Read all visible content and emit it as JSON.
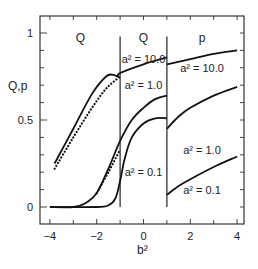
{
  "chart_data": {
    "type": "line",
    "title": "",
    "xlabel": "b²",
    "ylabel": "Q,p",
    "xlim": [
      -4.4,
      4.3
    ],
    "ylim": [
      -0.1,
      1.1
    ],
    "xticks": [
      -4,
      -2,
      0,
      2,
      4
    ],
    "xtick_labels": [
      "−4",
      "−2",
      "0",
      "2",
      "4"
    ],
    "yticks": [
      0,
      0.5,
      1
    ],
    "ytick_labels": [
      "0",
      "0.5",
      "1"
    ],
    "grid": false,
    "legend": null,
    "region_boundaries": [
      -1,
      1
    ],
    "region_labels": [
      {
        "text": "Q",
        "x": -2.7,
        "y": 0.97
      },
      {
        "text": "Q",
        "x": 0,
        "y": 0.97
      },
      {
        "text": "p",
        "x": 2.5,
        "y": 0.97
      }
    ],
    "annotations": [
      {
        "text": "a² = 10.0",
        "x": 0,
        "y": 0.85
      },
      {
        "text": "a² = 1.0",
        "x": 0,
        "y": 0.7
      },
      {
        "text": "a² = 0.1",
        "x": 0,
        "y": 0.2
      },
      {
        "text": "a² = 10.0",
        "x": 2.5,
        "y": 0.8
      },
      {
        "text": "a² = 1.0",
        "x": 2.5,
        "y": 0.33
      },
      {
        "text": "a² = 0.1",
        "x": 2.5,
        "y": 0.1
      }
    ],
    "series": [
      {
        "name": "a² = 10.0 (Q, solid)",
        "style": "solid",
        "x": [
          -3.8,
          -3.0,
          -2.2,
          -1.6,
          -1.3,
          -1.1,
          -1.0,
          0.0,
          1.0
        ],
        "y": [
          0.25,
          0.45,
          0.65,
          0.75,
          0.76,
          0.75,
          0.77,
          0.82,
          0.86
        ]
      },
      {
        "name": "a² = 10.0 (Q, dotted)",
        "style": "dotted",
        "x": [
          -3.8,
          -3.0,
          -2.2,
          -1.6,
          -1.0
        ],
        "y": [
          0.22,
          0.4,
          0.57,
          0.68,
          0.75
        ]
      },
      {
        "name": "a² = 10.0 (p)",
        "style": "solid",
        "x": [
          1.0,
          2.0,
          3.0,
          4.0
        ],
        "y": [
          0.82,
          0.85,
          0.88,
          0.9
        ]
      },
      {
        "name": "a² = 1.0 (Q, solid)",
        "style": "solid",
        "x": [
          -4.0,
          -3.0,
          -2.5,
          -2.0,
          -1.5,
          -1.0,
          -0.5,
          0.0,
          0.5,
          1.0
        ],
        "y": [
          0.0,
          0.0,
          0.02,
          0.08,
          0.22,
          0.38,
          0.5,
          0.57,
          0.62,
          0.64
        ]
      },
      {
        "name": "a² = 1.0 (Q, dotted)",
        "style": "dotted",
        "x": [
          -2.0,
          -1.5,
          -1.0
        ],
        "y": [
          0.08,
          0.2,
          0.33
        ]
      },
      {
        "name": "a² = 1.0 (p)",
        "style": "solid",
        "x": [
          1.0,
          1.5,
          2.0,
          3.0,
          4.0
        ],
        "y": [
          0.45,
          0.52,
          0.57,
          0.64,
          0.69
        ]
      },
      {
        "name": "a² = 0.1 (Q)",
        "style": "solid",
        "x": [
          -4.0,
          -2.0,
          -1.5,
          -1.2,
          -1.0,
          -0.8,
          -0.5,
          0.0,
          0.5,
          1.0
        ],
        "y": [
          0.0,
          0.0,
          0.01,
          0.05,
          0.15,
          0.28,
          0.4,
          0.48,
          0.51,
          0.51
        ]
      },
      {
        "name": "a² = 0.1 (p)",
        "style": "solid",
        "x": [
          1.0,
          1.5,
          2.0,
          3.0,
          4.0
        ],
        "y": [
          0.07,
          0.12,
          0.16,
          0.23,
          0.29
        ]
      }
    ]
  }
}
